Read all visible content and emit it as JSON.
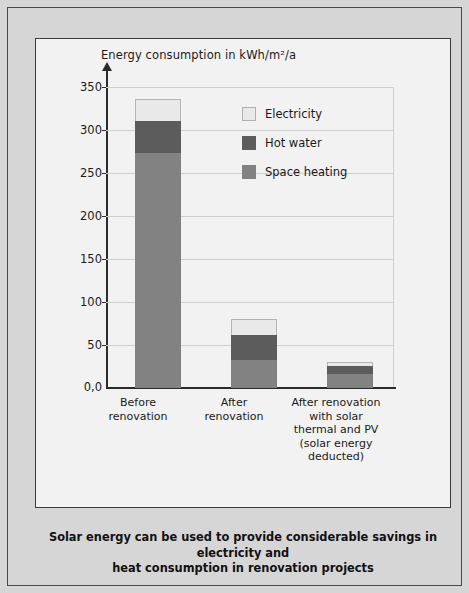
{
  "chart_data": {
    "type": "bar",
    "title": "",
    "ylabel": "Energy consumption in kWh/m²/a",
    "xlabel": "",
    "stacked": true,
    "grid": true,
    "legend_position": "inside-right",
    "ylim": [
      0,
      350
    ],
    "yticks": [
      "0,0",
      "50",
      "100",
      "150",
      "200",
      "250",
      "300",
      "350"
    ],
    "ytick_values": [
      0,
      50,
      100,
      150,
      200,
      250,
      300,
      350
    ],
    "categories": [
      "Before\nrenovation",
      "After\nrenovation",
      "After renovation\nwith solar\nthermal and PV\n(solar energy\ndeducted)"
    ],
    "series": [
      {
        "name": "Space heating",
        "color": "#828282",
        "values": [
          274,
          33,
          16
        ]
      },
      {
        "name": "Hot water",
        "color": "#5c5c5c",
        "values": [
          37,
          29,
          10
        ]
      },
      {
        "name": "Electricity",
        "color": "#e9e9e9",
        "values": [
          26,
          19,
          4
        ]
      }
    ],
    "totals": [
      337,
      81,
      30
    ]
  },
  "axis": {
    "title": "Energy consumption in kWh/m²/a",
    "ticks": [
      {
        "label": "350",
        "value": 350
      },
      {
        "label": "300",
        "value": 300
      },
      {
        "label": "250",
        "value": 250
      },
      {
        "label": "200",
        "value": 200
      },
      {
        "label": "150",
        "value": 150
      },
      {
        "label": "100",
        "value": 100
      },
      {
        "label": "50",
        "value": 50
      },
      {
        "label": "0,0",
        "value": 0
      }
    ]
  },
  "legend": {
    "items": [
      {
        "label": "Electricity",
        "color": "#e9e9e9"
      },
      {
        "label": "Hot water",
        "color": "#5c5c5c"
      },
      {
        "label": "Space heating",
        "color": "#828282"
      }
    ]
  },
  "categories": [
    {
      "line1": "Before",
      "line2": "renovation",
      "line3": "",
      "line4": "",
      "line5": ""
    },
    {
      "line1": "After",
      "line2": "renovation",
      "line3": "",
      "line4": "",
      "line5": ""
    },
    {
      "line1": "After renovation",
      "line2": "with solar",
      "line3": "thermal and PV",
      "line4": "(solar energy",
      "line5": "deducted)"
    }
  ],
  "caption": {
    "line1": "Solar energy can be used to provide considerable savings in electricity and",
    "line2": "heat consumption in renovation projects"
  }
}
